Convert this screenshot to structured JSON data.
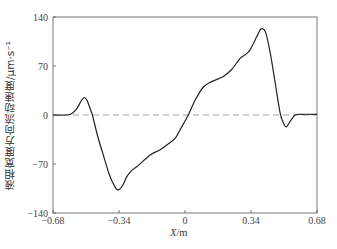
{
  "chart_data": {
    "type": "line",
    "title": "",
    "xlabel": "X/m",
    "ylabel": "液相宽度方向流动速度/μm·s⁻¹",
    "xlim": [
      -0.68,
      0.68
    ],
    "ylim": [
      -140,
      140
    ],
    "xticks": [
      -0.68,
      -0.34,
      0,
      0.34,
      0.68
    ],
    "xtick_labels": [
      "−0.68",
      "−0.34",
      "0",
      "0.34",
      "0.68"
    ],
    "yticks": [
      -140,
      -70,
      0,
      70,
      140
    ],
    "ytick_labels": [
      "−140",
      "−70",
      "0",
      "70",
      "140"
    ],
    "grid": false,
    "legend": null,
    "reference_line": {
      "y": 0,
      "style": "dashed",
      "color": "#999999"
    },
    "series": [
      {
        "name": "velocity",
        "color": "#222222",
        "x": [
          -0.68,
          -0.62,
          -0.59,
          -0.56,
          -0.535,
          -0.519,
          -0.505,
          -0.49,
          -0.477,
          -0.45,
          -0.42,
          -0.39,
          -0.36,
          -0.343,
          -0.32,
          -0.3,
          -0.274,
          -0.24,
          -0.18,
          -0.13,
          -0.094,
          -0.05,
          -0.025,
          0.017,
          0.05,
          0.095,
          0.14,
          0.198,
          0.24,
          0.284,
          0.31,
          0.335,
          0.37,
          0.392,
          0.415,
          0.439,
          0.465,
          0.49,
          0.505,
          0.521,
          0.54,
          0.567,
          0.6,
          0.68
        ],
        "values": [
          0,
          0,
          1,
          8,
          20,
          25,
          21,
          10,
          0,
          -30,
          -58,
          -85,
          -103,
          -107,
          -100,
          -88,
          -79,
          -72,
          -57,
          -50,
          -43,
          -33,
          -21,
          0,
          20,
          40,
          48,
          55,
          65,
          81,
          86,
          93,
          112,
          123,
          118,
          89,
          45,
          3,
          -10,
          -17,
          -10,
          0,
          1,
          1
        ]
      }
    ]
  },
  "axes": {
    "xlabel_italic": "X",
    "xlabel_unit": "/m"
  }
}
